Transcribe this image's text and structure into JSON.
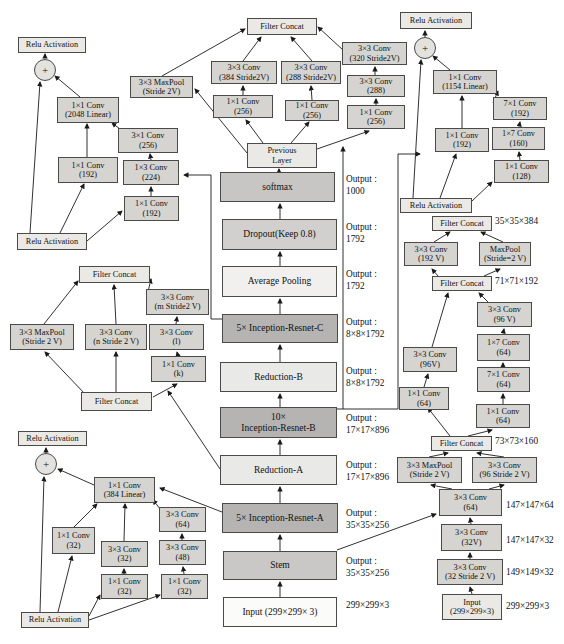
{
  "nodes": [
    {
      "id": "relu_c_top",
      "lines": [
        "Relu Activation"
      ]
    },
    {
      "id": "plus_c",
      "lines": [
        "+"
      ]
    },
    {
      "id": "conv2048",
      "lines": [
        "1×1 Conv",
        "(2048 Linear)"
      ]
    },
    {
      "id": "conv192l_c",
      "lines": [
        "1×1 Conv",
        "(192)"
      ]
    },
    {
      "id": "conv256_31",
      "lines": [
        "3×1 Conv",
        "(256)"
      ]
    },
    {
      "id": "conv224_13",
      "lines": [
        "1×3 Conv",
        "(224)"
      ]
    },
    {
      "id": "conv192b_c",
      "lines": [
        "1×1 Conv",
        "(192)"
      ]
    },
    {
      "id": "relu_c_bot",
      "lines": [
        "Relu Activation"
      ]
    },
    {
      "id": "fc_rb",
      "lines": [
        "Filter Concat"
      ]
    },
    {
      "id": "mp_rb",
      "lines": [
        "3×3 MaxPool",
        "(Stride 2V)"
      ]
    },
    {
      "id": "c384s",
      "lines": [
        "3×3 Conv",
        "(384 Stride2V)"
      ]
    },
    {
      "id": "c256a",
      "lines": [
        "1×1 Conv",
        "(256)"
      ]
    },
    {
      "id": "c288s",
      "lines": [
        "3×3 Conv",
        "(288 Stride2V)"
      ]
    },
    {
      "id": "c256b",
      "lines": [
        "1×1 Conv",
        "(256)"
      ]
    },
    {
      "id": "c320s",
      "lines": [
        "3×3 Conv",
        "(320 Stride2V)"
      ]
    },
    {
      "id": "c288",
      "lines": [
        "3×3 Conv",
        "(288)"
      ]
    },
    {
      "id": "c256c",
      "lines": [
        "1×1 Conv",
        "(256)"
      ]
    },
    {
      "id": "prev_rb",
      "lines": [
        "Previous",
        "Layer"
      ]
    },
    {
      "id": "relu_b_top",
      "lines": [
        "Relu Activation"
      ]
    },
    {
      "id": "plus_b",
      "lines": [
        "+"
      ]
    },
    {
      "id": "conv1154",
      "lines": [
        "1×1 Conv",
        "(1154 Linear)"
      ]
    },
    {
      "id": "conv192_b",
      "lines": [
        "1×1 Conv",
        "(192)"
      ]
    },
    {
      "id": "conv71_192",
      "lines": [
        "7×1 Conv",
        "(192)"
      ]
    },
    {
      "id": "conv17_160",
      "lines": [
        "1×7 Conv",
        "(160)"
      ]
    },
    {
      "id": "conv128",
      "lines": [
        "1×1 Conv",
        "(128)"
      ]
    },
    {
      "id": "relu_b_bot",
      "lines": [
        "Relu Activation"
      ]
    },
    {
      "id": "fc_ra_top",
      "lines": [
        "Filter Concat"
      ]
    },
    {
      "id": "mp_ra",
      "lines": [
        "3×3 MaxPool",
        "(Stride 2 V)"
      ]
    },
    {
      "id": "conv_n",
      "lines": [
        "3×3 Conv",
        "(n Stride 2 V)"
      ]
    },
    {
      "id": "conv_m",
      "lines": [
        "3×3 Conv",
        "(m Stride2 V)"
      ]
    },
    {
      "id": "conv_l",
      "lines": [
        "3×3 Conv",
        "(l)"
      ]
    },
    {
      "id": "conv_k",
      "lines": [
        "1×1 Conv",
        "(k)"
      ]
    },
    {
      "id": "fc_ra_bot",
      "lines": [
        "Filter Concat"
      ]
    },
    {
      "id": "relu_a_top",
      "lines": [
        "Relu Activation"
      ]
    },
    {
      "id": "plus_a",
      "lines": [
        "+"
      ]
    },
    {
      "id": "conv384",
      "lines": [
        "1×1 Conv",
        "(384 Linear)"
      ]
    },
    {
      "id": "conv32l",
      "lines": [
        "1×1 Conv",
        "(32)"
      ]
    },
    {
      "id": "conv32m3",
      "lines": [
        "3×3 Conv",
        "(32)"
      ]
    },
    {
      "id": "conv32m1",
      "lines": [
        "1×1 Conv",
        "(32)"
      ]
    },
    {
      "id": "conv64a",
      "lines": [
        "3×3 Conv",
        "(64)"
      ]
    },
    {
      "id": "conv48",
      "lines": [
        "3×3 Conv",
        "(48)"
      ]
    },
    {
      "id": "conv32r",
      "lines": [
        "1×1 Conv",
        "(32)"
      ]
    },
    {
      "id": "relu_a_bot",
      "lines": [
        "Relu Activation"
      ]
    },
    {
      "id": "input_main",
      "lines": [
        "Input (299×299× 3)"
      ]
    },
    {
      "id": "stem_main",
      "lines": [
        "Stem"
      ]
    },
    {
      "id": "ira_main",
      "lines": [
        "5× Inception-Resnet-A"
      ]
    },
    {
      "id": "reda_main",
      "lines": [
        "Reduction-A"
      ]
    },
    {
      "id": "irb_main",
      "lines": [
        "10×",
        "Inception-Resnet-B"
      ]
    },
    {
      "id": "redb_main",
      "lines": [
        "Reduction-B"
      ]
    },
    {
      "id": "irc_main",
      "lines": [
        "5× Inception-Resnet-C"
      ]
    },
    {
      "id": "avgpool_main",
      "lines": [
        "Average Pooling"
      ]
    },
    {
      "id": "dropout_main",
      "lines": [
        "Dropout(Keep 0.8)"
      ]
    },
    {
      "id": "softmax_main",
      "lines": [
        "softmax"
      ]
    },
    {
      "id": "fc_s1",
      "lines": [
        "Filter Concat"
      ]
    },
    {
      "id": "c192v",
      "lines": [
        "3×3 Conv",
        "(192 V)"
      ]
    },
    {
      "id": "mp_s",
      "lines": [
        "MaxPool",
        "(Stride=2 V)"
      ]
    },
    {
      "id": "fc_s2",
      "lines": [
        "Filter Concat"
      ]
    },
    {
      "id": "c96vr",
      "lines": [
        "3×3 Conv",
        "(96 V)"
      ]
    },
    {
      "id": "c1764",
      "lines": [
        "1×7 Conv",
        "(64)"
      ]
    },
    {
      "id": "c7164",
      "lines": [
        "7×1 Conv",
        "(64)"
      ]
    },
    {
      "id": "c1164r",
      "lines": [
        "1×1 Conv",
        "(64)"
      ]
    },
    {
      "id": "c96vl",
      "lines": [
        "3×3 Conv",
        "(96V)"
      ]
    },
    {
      "id": "c1164l",
      "lines": [
        "1×1 Conv",
        "(64)"
      ]
    },
    {
      "id": "fc_s3",
      "lines": [
        "Filter Concat"
      ]
    },
    {
      "id": "mp_s2",
      "lines": [
        "3×3 MaxPool",
        "(Stride 2 V)"
      ]
    },
    {
      "id": "c96s2",
      "lines": [
        "3×3 Conv",
        "(96 Stride 2 V)"
      ]
    },
    {
      "id": "c64s",
      "lines": [
        "3×3 Conv",
        "(64)"
      ]
    },
    {
      "id": "c32v",
      "lines": [
        "3×3 Conv",
        "(32V)"
      ]
    },
    {
      "id": "c32s2",
      "lines": [
        "3×3 Conv",
        "(32 Stride 2 V)"
      ]
    },
    {
      "id": "input_s",
      "lines": [
        "Input",
        "(299×299×3)"
      ]
    }
  ],
  "labels": [
    {
      "id": "out_softmax",
      "lines": [
        "Output :",
        "1000"
      ]
    },
    {
      "id": "out_dropout",
      "lines": [
        "Output :",
        "1792"
      ]
    },
    {
      "id": "out_avg",
      "lines": [
        "Output :",
        "1792"
      ]
    },
    {
      "id": "out_irc",
      "lines": [
        "Output :",
        "8×8×1792"
      ]
    },
    {
      "id": "out_redb",
      "lines": [
        "Output :",
        "8×8×1792"
      ]
    },
    {
      "id": "out_irb",
      "lines": [
        "Output :",
        "17×17×896"
      ]
    },
    {
      "id": "out_reda",
      "lines": [
        "Output :",
        "17×17×896"
      ]
    },
    {
      "id": "out_ira",
      "lines": [
        "Output :",
        "35×35×256"
      ]
    },
    {
      "id": "out_stem",
      "lines": [
        "Output :",
        "35×35×256"
      ]
    },
    {
      "id": "out_input",
      "lines": [
        "299×299×3"
      ]
    },
    {
      "id": "shp_fc1",
      "lines": [
        "35×35×384"
      ]
    },
    {
      "id": "shp_fc2",
      "lines": [
        "71×71×192"
      ]
    },
    {
      "id": "shp_fc3",
      "lines": [
        "73×73×160"
      ]
    },
    {
      "id": "shp_c64",
      "lines": [
        "147×147×64"
      ]
    },
    {
      "id": "shp_c32v",
      "lines": [
        "147×147×32"
      ]
    },
    {
      "id": "shp_c32s",
      "lines": [
        "149×149×32"
      ]
    },
    {
      "id": "shp_input",
      "lines": [
        "299×299×3"
      ]
    }
  ],
  "colors": {
    "box_fill": "#d5d4d0",
    "light_fill": "#eae9e5",
    "dark_block": "#b5b4b2",
    "stroke": "#1a1a1a"
  }
}
